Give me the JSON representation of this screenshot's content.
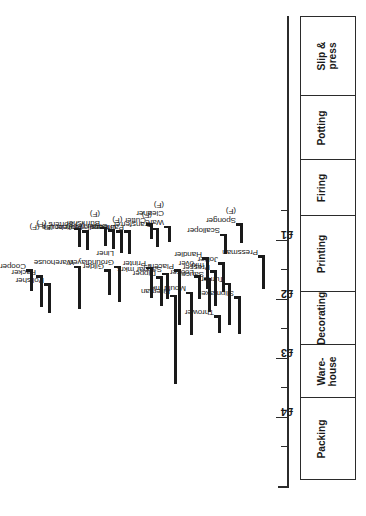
{
  "chart_data": {
    "type": "bar",
    "title": "",
    "xlabel": "",
    "ylabel": "",
    "orientation": "horizontal-range-rotated",
    "value_axis": {
      "unit": "£",
      "ticks": [
        "£4",
        "£3",
        "£2",
        "£1"
      ],
      "tick_values": [
        4,
        3,
        2,
        1
      ],
      "minor_ticks": [
        4.5,
        3.5,
        2.5,
        1.5,
        0.5
      ],
      "range": [
        0.2,
        4.6
      ],
      "grid": false
    },
    "legend": [],
    "note": "(F) denotes female occupations",
    "departments": [
      {
        "label": "Slip &\npress"
      },
      {
        "label": "Potting"
      },
      {
        "label": "Firing"
      },
      {
        "label": "Printing"
      },
      {
        "label": "Decorating"
      },
      {
        "label": "Ware-\nhouse"
      },
      {
        "label": "Packing"
      }
    ],
    "bars": [
      {
        "name": "Slipmaker",
        "low": 1.98,
        "high": 2.58,
        "dept": "Slip & press"
      },
      {
        "name": "Pressman",
        "low": 1.28,
        "high": 1.82,
        "dept": "Slip & press"
      },
      {
        "name": "Thrower",
        "low": 2.3,
        "high": 2.56,
        "dept": "Potting"
      },
      {
        "name": "Turner",
        "low": 1.75,
        "high": 2.42,
        "dept": "Potting"
      },
      {
        "name": "Saucer\nmkr",
        "low": 1.66,
        "high": 2.2,
        "dept": "Potting"
      },
      {
        "name": "Presser",
        "low": 1.54,
        "high": 2.1,
        "dept": "Potting"
      },
      {
        "name": "Mould mkr",
        "low": 1.9,
        "high": 2.6,
        "dept": "Potting"
      },
      {
        "name": "Looker\nover",
        "low": 1.62,
        "high": 1.98,
        "dept": "Potting"
      },
      {
        "name": "Jollier",
        "low": 1.4,
        "high": 1.86,
        "dept": "Potting"
      },
      {
        "name": "Handler",
        "low": 1.32,
        "high": 1.82,
        "dept": "Potting"
      },
      {
        "name": "Scalloper",
        "low": 0.92,
        "high": 1.22,
        "dept": "Potting"
      },
      {
        "name": "Sponger\n(F)",
        "low": 0.74,
        "high": 1.04,
        "dept": "Potting"
      },
      {
        "name": "Fireman",
        "low": 1.95,
        "high": 3.42,
        "dept": "Firing"
      },
      {
        "name": "Dipper",
        "low": 1.64,
        "high": 2.1,
        "dept": "Firing"
      },
      {
        "name": "Saggar mkrs",
        "low": 1.58,
        "high": 1.98,
        "dept": "Firing"
      },
      {
        "name": "Placers",
        "low": 1.52,
        "high": 2.42,
        "dept": "Firing"
      },
      {
        "name": "Printer",
        "low": 1.48,
        "high": 1.96,
        "dept": "Printing"
      },
      {
        "name": "Ware\nCleaner\n(F)",
        "low": 0.78,
        "high": 1.02,
        "dept": "Printing"
      },
      {
        "name": "Transferrer\n(F)",
        "low": 0.82,
        "high": 1.1,
        "dept": "Printing"
      },
      {
        "name": "Cutter (F)",
        "low": 0.74,
        "high": 0.96,
        "dept": "Printing"
      },
      {
        "name": "Groundlayer/\nLiner",
        "low": 1.46,
        "high": 2.04,
        "dept": "Decorating"
      },
      {
        "name": "Gilder",
        "low": 1.52,
        "high": 1.92,
        "dept": "Decorating"
      },
      {
        "name": "Paintress",
        "low": 0.86,
        "high": 1.22,
        "dept": "Decorating"
      },
      {
        "name": "Groundlayer/liner (F)",
        "low": 0.86,
        "high": 1.2,
        "dept": "Decorating"
      },
      {
        "name": "Gilder (F)",
        "low": 0.84,
        "high": 1.14,
        "dept": "Decorating"
      },
      {
        "name": "Burnisher\n(F)",
        "low": 0.8,
        "high": 1.08,
        "dept": "Decorating"
      },
      {
        "name": "Warehouse",
        "low": 1.46,
        "high": 2.16,
        "dept": "Warehouse"
      },
      {
        "name": "Warehouse (F)",
        "low": 0.86,
        "high": 1.16,
        "dept": "Warehouse"
      },
      {
        "name": "Sorters (F)",
        "low": 0.82,
        "high": 1.1,
        "dept": "Warehouse"
      },
      {
        "name": "Polisher",
        "low": 1.76,
        "high": 2.22,
        "dept": "Packing"
      },
      {
        "name": "Packer",
        "low": 1.62,
        "high": 2.12,
        "dept": "Packing"
      },
      {
        "name": "Cooper",
        "low": 1.52,
        "high": 1.84,
        "dept": "Packing"
      }
    ]
  }
}
